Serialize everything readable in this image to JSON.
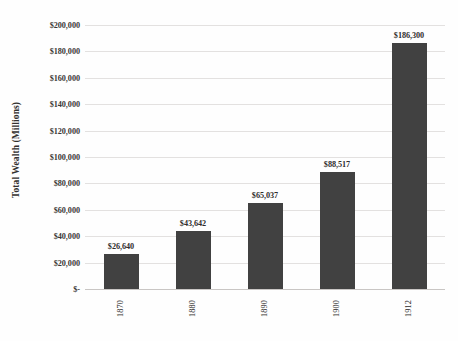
{
  "chart_data": {
    "type": "bar",
    "title": "Total Wealth of the United States",
    "xlabel": "",
    "ylabel": "Total Wealth (Millions)",
    "categories": [
      "1870",
      "1880",
      "1890",
      "1900",
      "1912"
    ],
    "values": [
      26640,
      43642,
      65037,
      88517,
      186300
    ],
    "value_labels": [
      "$26,640",
      "$43,642",
      "$65,037",
      "$88,517",
      "$186,300"
    ],
    "ylim": [
      0,
      200000
    ],
    "ytick_values": [
      200000,
      180000,
      160000,
      140000,
      120000,
      100000,
      80000,
      60000,
      40000,
      20000,
      0
    ],
    "ytick_labels": [
      "$200,000",
      "$180,000",
      "$160,000",
      "$140,000",
      "$120,000",
      "$100,000",
      "$80,000",
      "$60,000",
      "$40,000",
      "$20,000",
      "$-"
    ],
    "grid": true,
    "grid_axis": "y",
    "legend": false,
    "legend_position": "none",
    "series": [
      {
        "name": "Total Wealth (Millions)",
        "values": [
          26640,
          43642,
          65037,
          88517,
          186300
        ]
      }
    ],
    "colors": {
      "bar": "#414141",
      "gridline": "#e3e1e0",
      "axis": "#c9c6c4",
      "text": "#2f2d2c",
      "background": "#fefefe"
    }
  }
}
